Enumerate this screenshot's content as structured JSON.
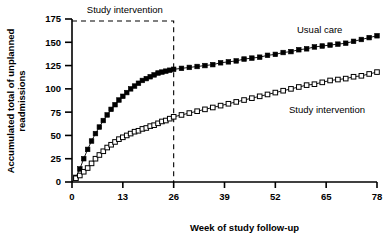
{
  "chart_data": {
    "type": "line",
    "title": "",
    "xlabel": "Week of study follow-up",
    "ylabel": "Accumulated total of unplanned readmissions",
    "ylabel_line1": "Accumulated total of unplanned",
    "ylabel_line2": "readmissions",
    "xlim": [
      0,
      78
    ],
    "ylim": [
      0,
      175
    ],
    "xticks": [
      0,
      13,
      26,
      39,
      52,
      65,
      78
    ],
    "xtick_labels": [
      "0",
      "13",
      "26",
      "39",
      "52",
      "65",
      "78"
    ],
    "yticks": [
      0,
      25,
      50,
      75,
      100,
      125,
      150,
      175
    ],
    "ytick_labels": [
      "0",
      "25",
      "50",
      "75",
      "100",
      "125",
      "150",
      "175"
    ],
    "grid": false,
    "legend_position": "inline-annotation",
    "annotations": [
      {
        "text": "Study intervention",
        "role": "intervention-period-band-label",
        "x_start": 0,
        "x_end": 26
      }
    ],
    "intervention_band": {
      "label": "Study intervention",
      "x_start": 0,
      "x_end": 26,
      "y_top": 175,
      "style": "dashed-rectangle"
    },
    "x": [
      0,
      1,
      2,
      3,
      4,
      5,
      6,
      7,
      8,
      9,
      10,
      11,
      12,
      13,
      14,
      15,
      16,
      17,
      18,
      19,
      20,
      21,
      22,
      23,
      24,
      25,
      26,
      28,
      30,
      32,
      34,
      36,
      38,
      40,
      42,
      44,
      46,
      48,
      50,
      52,
      54,
      56,
      58,
      60,
      62,
      64,
      66,
      68,
      70,
      72,
      74,
      76,
      78
    ],
    "series": [
      {
        "name": "Usual care",
        "marker": "filled-square",
        "color": "#000000",
        "values": [
          0,
          5,
          14,
          25,
          35,
          44,
          52,
          59,
          66,
          72,
          78,
          83,
          88,
          92,
          96,
          100,
          103,
          106,
          109,
          111,
          113,
          115,
          117,
          118,
          119,
          120,
          121,
          122,
          123,
          124,
          125,
          126,
          128,
          129,
          130,
          132,
          133,
          134,
          136,
          137,
          139,
          140,
          142,
          143,
          145,
          146,
          147,
          148,
          149,
          151,
          153,
          155,
          157
        ]
      },
      {
        "name": "Study intervention",
        "marker": "open-square",
        "color": "#000000",
        "values": [
          0,
          4,
          7,
          11,
          15,
          20,
          25,
          29,
          33,
          37,
          40,
          43,
          46,
          48,
          50,
          52,
          54,
          55,
          57,
          58,
          60,
          61,
          63,
          65,
          66,
          68,
          70,
          72,
          74,
          76,
          78,
          80,
          82,
          84,
          86,
          88,
          90,
          92,
          94,
          96,
          98,
          100,
          102,
          104,
          105,
          107,
          109,
          110,
          111,
          113,
          114,
          116,
          118
        ]
      }
    ]
  },
  "labels": {
    "usual_care": "Usual care",
    "study_intervention": "Study intervention",
    "band_title": "Study intervention"
  }
}
